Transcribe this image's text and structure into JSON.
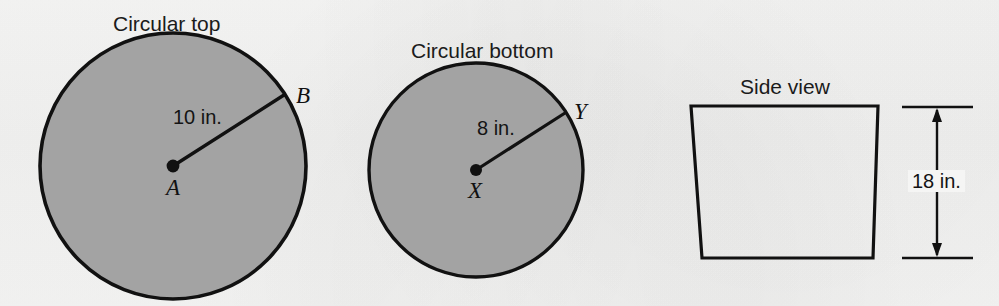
{
  "figure": {
    "title_top": "Circular top",
    "title_bottom": "Circular bottom",
    "title_side": "Side view",
    "background_color": "#f5f5f4",
    "shape_fill_color": "#a3a3a3",
    "stroke_color": "#111111"
  },
  "circular_top": {
    "label": "Circular top",
    "center_point_label": "A",
    "edge_point_label": "B",
    "radius_label": "10 in.",
    "radius_value": 10,
    "units": "in."
  },
  "circular_bottom": {
    "label": "Circular bottom",
    "center_point_label": "X",
    "edge_point_label": "Y",
    "radius_label": "8 in.",
    "radius_value": 8,
    "units": "in."
  },
  "side_view": {
    "label": "Side view",
    "height_label": "18 in.",
    "height_value": 18,
    "units": "in."
  }
}
